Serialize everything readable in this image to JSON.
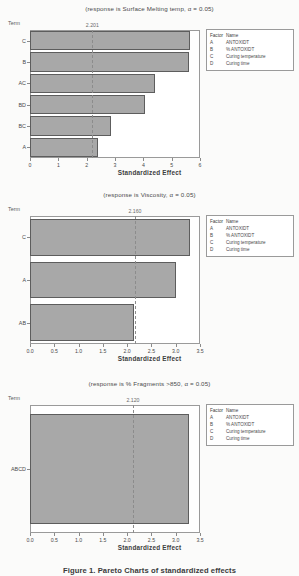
{
  "document": {
    "caption": "Figure 1. Pareto Charts of standardized effects"
  },
  "legend": {
    "header": {
      "factor": "Factor",
      "name": "Name"
    },
    "rows": [
      {
        "factor": "A",
        "name": "ANTOXIDT"
      },
      {
        "factor": "B",
        "name": "% ANTOXIDT"
      },
      {
        "factor": "C",
        "name": "Curing temperature"
      },
      {
        "factor": "D",
        "name": "Curing time"
      }
    ]
  },
  "chart_data": [
    {
      "type": "bar",
      "orientation": "horizontal",
      "title": "(response is Surface Melting temp, α = 0.05)",
      "ylabel": "Term",
      "xlabel": "Standardized Effect",
      "categories": [
        "C",
        "B",
        "AC",
        "BD",
        "BC",
        "A"
      ],
      "values": [
        5.65,
        5.6,
        4.4,
        4.05,
        2.85,
        2.4
      ],
      "xlim": [
        0,
        6
      ],
      "xticks": [
        "0",
        "1",
        "2",
        "3",
        "4",
        "5",
        "6"
      ],
      "xtick_values": [
        0,
        1,
        2,
        3,
        4,
        5,
        6
      ],
      "reference_line": 2.201,
      "reference_label": "2.201",
      "grid": false,
      "legend_position": "right"
    },
    {
      "type": "bar",
      "orientation": "horizontal",
      "title": "(response is Viscosity, α = 0.05)",
      "ylabel": "Term",
      "xlabel": "Standardized Effect",
      "categories": [
        "C",
        "A",
        "AB"
      ],
      "values": [
        3.3,
        3.0,
        2.15
      ],
      "xlim": [
        0,
        3.5
      ],
      "xticks": [
        "0.0",
        "0.5",
        "1.0",
        "1.5",
        "2.0",
        "2.5",
        "3.0",
        "3.5"
      ],
      "xtick_values": [
        0,
        0.5,
        1.0,
        1.5,
        2.0,
        2.5,
        3.0,
        3.5
      ],
      "reference_line": 2.16,
      "reference_label": "2.160",
      "grid": false,
      "legend_position": "right"
    },
    {
      "type": "bar",
      "orientation": "horizontal",
      "title": "(response is % Fragments >850, α = 0.05)",
      "ylabel": "Term",
      "xlabel": "Standardized Effect",
      "categories": [
        "ABCD"
      ],
      "values": [
        3.27
      ],
      "xlim": [
        0,
        3.5
      ],
      "xticks": [
        "0.0",
        "0.5",
        "1.0",
        "1.5",
        "2.0",
        "2.5",
        "3.0",
        "3.5"
      ],
      "xtick_values": [
        0,
        0.5,
        1.0,
        1.5,
        2.0,
        2.5,
        3.0,
        3.5
      ],
      "reference_line": 2.12,
      "reference_label": "2.120",
      "grid": false,
      "legend_position": "right"
    }
  ],
  "colors": {
    "bar_fill": "#a8a8a8",
    "bar_stroke": "#5d5d5d",
    "plot_bg": "#ffffff",
    "page_bg": "#fbfbfa",
    "axis": "#8a8a8a"
  }
}
